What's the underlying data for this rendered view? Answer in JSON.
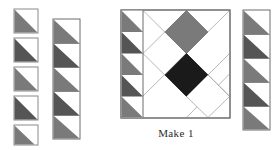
{
  "document": {
    "kind": "quilt-block-assembly-diagram",
    "width": 279,
    "height": 150,
    "background_color": "#ffffff"
  },
  "caption": {
    "text": "Make 1",
    "color": "#2b2b2b",
    "x": 176,
    "y": 137,
    "font_size": 11
  },
  "palette": {
    "white": "#ffffff",
    "medium_gray": "#7a7a7a",
    "dark_gray": "#555555",
    "near_black": "#1a1a1a",
    "outline": "#8a8a8a",
    "outline_dark": "#6d6d6d",
    "thin_line": "#9a9a9a"
  },
  "units": {
    "square_size": 24,
    "triangle_orientation": "lower-left",
    "description": "half-square triangle"
  },
  "groups": [
    {
      "name": "loose-hst-column",
      "label": "loose half-square triangle squares",
      "layout": "separated",
      "x": 14,
      "y": 9,
      "size": 24,
      "gap": 5,
      "count": 5,
      "fills": [
        "#7a7a7a",
        "#555555",
        "#7a7a7a",
        "#555555",
        "#7a7a7a"
      ]
    },
    {
      "name": "left-hst-strip",
      "label": "sewn half-square triangle strip",
      "layout": "contiguous",
      "x": 53,
      "y": 19,
      "size": 24,
      "gap": 0,
      "count": 5,
      "fills": [
        "#7a7a7a",
        "#555555",
        "#7a7a7a",
        "#555555",
        "#7a7a7a"
      ]
    },
    {
      "name": "right-hst-strip",
      "label": "sewn half-square triangle strip",
      "layout": "contiguous",
      "x": 243,
      "y": 10,
      "size": 24,
      "gap": 0,
      "count": 5,
      "fills": [
        "#7a7a7a",
        "#555555",
        "#7a7a7a",
        "#555555",
        "#7a7a7a"
      ]
    }
  ],
  "main_block": {
    "name": "assembled-quilt-block",
    "x": 121,
    "y": 10,
    "width": 109,
    "height": 108,
    "inner_strip": {
      "name": "block-left-hst-strip",
      "x": 121,
      "y": 10,
      "size": 21.6,
      "count": 5,
      "fills": [
        "#7a7a7a",
        "#555555",
        "#7a7a7a",
        "#555555",
        "#7a7a7a"
      ]
    },
    "center": {
      "top_diamond_fill": "#7a7a7a",
      "center_diamond_fill": "#1a1a1a",
      "background_fill": "#ffffff",
      "guide_line_color": "#9a9a9a"
    }
  }
}
